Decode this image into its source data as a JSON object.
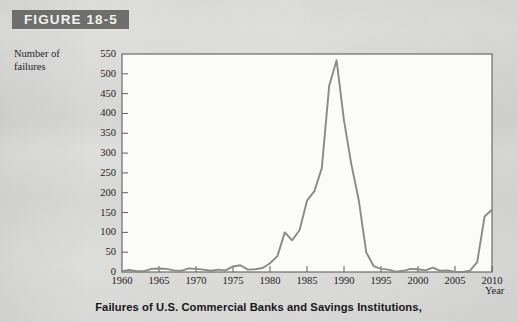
{
  "figure": {
    "label": "FIGURE 18-5",
    "band_color": "#6e6e6c"
  },
  "caption": "Failures of U.S. Commercial Banks and Savings Institutions,",
  "chart_data": {
    "type": "line",
    "title": "",
    "xlabel": "Year",
    "ylabel_line1": "Number of",
    "ylabel_line2": "failures",
    "xlim": [
      1960,
      2010
    ],
    "ylim": [
      0,
      550
    ],
    "xticks": [
      1960,
      1965,
      1970,
      1975,
      1980,
      1985,
      1990,
      1995,
      2000,
      2005,
      2010
    ],
    "yticks": [
      0,
      50,
      100,
      150,
      200,
      250,
      300,
      350,
      400,
      450,
      500,
      550
    ],
    "grid": false,
    "legend": "none",
    "line_color": "#8a8a88",
    "series": [
      {
        "name": "Failures of U.S. Commercial Banks and Savings Institutions",
        "x": [
          1960,
          1961,
          1962,
          1963,
          1964,
          1965,
          1966,
          1967,
          1968,
          1969,
          1970,
          1971,
          1972,
          1973,
          1974,
          1975,
          1976,
          1977,
          1978,
          1979,
          1980,
          1981,
          1982,
          1983,
          1984,
          1985,
          1986,
          1987,
          1988,
          1989,
          1990,
          1991,
          1992,
          1993,
          1994,
          1995,
          1996,
          1997,
          1998,
          1999,
          2000,
          2001,
          2002,
          2003,
          2004,
          2005,
          2006,
          2007,
          2008,
          2009,
          2010
        ],
        "values": [
          2,
          5,
          2,
          2,
          8,
          9,
          8,
          4,
          3,
          9,
          8,
          6,
          3,
          6,
          4,
          14,
          17,
          6,
          7,
          10,
          22,
          40,
          100,
          80,
          106,
          180,
          204,
          262,
          470,
          534,
          382,
          271,
          181,
          50,
          15,
          8,
          6,
          1,
          3,
          8,
          7,
          4,
          11,
          3,
          4,
          0,
          0,
          3,
          25,
          140,
          157
        ]
      }
    ],
    "annotations": []
  }
}
